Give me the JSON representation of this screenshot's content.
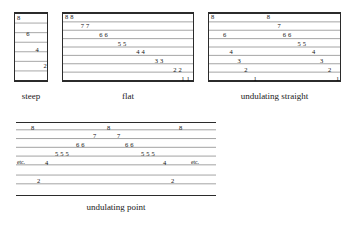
{
  "figure": {
    "kind": "contour-gradient-plan-diagram",
    "background_color": "#ffffff",
    "contour_color": "#8c8c8c",
    "frame_color": "#2b2b2b",
    "text_color": "#111111"
  },
  "panels": [
    {
      "id": "steep",
      "caption": "steep",
      "boxed": true,
      "x": 14,
      "y": 12,
      "w": 34,
      "h": 70,
      "contours": [
        {
          "y": 0.0,
          "heavy": true,
          "x1": 0.0,
          "x2": 1.0
        },
        {
          "y": 0.143,
          "heavy": false,
          "x1": 0.0,
          "x2": 1.0
        },
        {
          "y": 0.286,
          "heavy": false,
          "x1": 0.0,
          "x2": 1.0
        },
        {
          "y": 0.429,
          "heavy": false,
          "x1": 0.0,
          "x2": 1.0
        },
        {
          "y": 0.571,
          "heavy": false,
          "x1": 0.0,
          "x2": 1.0
        },
        {
          "y": 0.714,
          "heavy": false,
          "x1": 0.0,
          "x2": 1.0
        },
        {
          "y": 0.857,
          "heavy": false,
          "x1": 0.0,
          "x2": 1.0
        },
        {
          "y": 1.0,
          "heavy": true,
          "x1": 0.0,
          "x2": 1.0
        }
      ],
      "labels": [
        {
          "text": "8",
          "x": 0.06,
          "y": 0.03
        },
        {
          "text": "6",
          "x": 0.33,
          "y": 0.25
        },
        {
          "text": "4",
          "x": 0.6,
          "y": 0.48
        },
        {
          "text": "2",
          "x": 0.84,
          "y": 0.71
        }
      ],
      "etc": []
    },
    {
      "id": "flat",
      "caption": "flat",
      "boxed": true,
      "x": 62,
      "y": 12,
      "w": 132,
      "h": 70,
      "contours": [
        {
          "y": 0.0,
          "heavy": true,
          "x1": 0.0,
          "x2": 1.0
        },
        {
          "y": 0.125,
          "heavy": false,
          "x1": 0.0,
          "x2": 1.0
        },
        {
          "y": 0.25,
          "heavy": false,
          "x1": 0.0,
          "x2": 1.0
        },
        {
          "y": 0.375,
          "heavy": false,
          "x1": 0.0,
          "x2": 1.0
        },
        {
          "y": 0.5,
          "heavy": false,
          "x1": 0.0,
          "x2": 1.0
        },
        {
          "y": 0.625,
          "heavy": false,
          "x1": 0.0,
          "x2": 1.0
        },
        {
          "y": 0.75,
          "heavy": false,
          "x1": 0.0,
          "x2": 1.0
        },
        {
          "y": 0.875,
          "heavy": false,
          "x1": 0.0,
          "x2": 1.0
        },
        {
          "y": 1.0,
          "heavy": true,
          "x1": 0.0,
          "x2": 1.0
        }
      ],
      "labels": [
        {
          "text": "8 8",
          "x": 0.015,
          "y": 0.02
        },
        {
          "text": "7 7",
          "x": 0.135,
          "y": 0.145
        },
        {
          "text": "6 6",
          "x": 0.275,
          "y": 0.27
        },
        {
          "text": "5 5",
          "x": 0.415,
          "y": 0.395
        },
        {
          "text": "4 4",
          "x": 0.555,
          "y": 0.52
        },
        {
          "text": "3 3",
          "x": 0.695,
          "y": 0.645
        },
        {
          "text": "2 2",
          "x": 0.835,
          "y": 0.77
        },
        {
          "text": "1 1",
          "x": 0.895,
          "y": 0.895
        }
      ],
      "etc": []
    },
    {
      "id": "undulating-straight",
      "caption": "undulating straight",
      "boxed": true,
      "x": 208,
      "y": 12,
      "w": 133,
      "h": 70,
      "contours": [
        {
          "y": 0.0,
          "heavy": true,
          "x1": 0.0,
          "x2": 1.0
        },
        {
          "y": 0.125,
          "heavy": false,
          "x1": 0.0,
          "x2": 1.0
        },
        {
          "y": 0.25,
          "heavy": false,
          "x1": 0.0,
          "x2": 1.0
        },
        {
          "y": 0.375,
          "heavy": false,
          "x1": 0.0,
          "x2": 1.0
        },
        {
          "y": 0.5,
          "heavy": false,
          "x1": 0.0,
          "x2": 1.0
        },
        {
          "y": 0.625,
          "heavy": false,
          "x1": 0.0,
          "x2": 1.0
        },
        {
          "y": 0.75,
          "heavy": false,
          "x1": 0.0,
          "x2": 1.0
        },
        {
          "y": 0.875,
          "heavy": false,
          "x1": 0.0,
          "x2": 1.0
        },
        {
          "y": 1.0,
          "heavy": true,
          "x1": 0.0,
          "x2": 1.0
        }
      ],
      "labels": [
        {
          "text": "8",
          "x": 0.015,
          "y": 0.02
        },
        {
          "text": "8",
          "x": 0.435,
          "y": 0.02
        },
        {
          "text": "7",
          "x": 0.515,
          "y": 0.145
        },
        {
          "text": "6",
          "x": 0.105,
          "y": 0.27
        },
        {
          "text": "6 6",
          "x": 0.555,
          "y": 0.27
        },
        {
          "text": "5 5",
          "x": 0.665,
          "y": 0.395
        },
        {
          "text": "4",
          "x": 0.155,
          "y": 0.52
        },
        {
          "text": "4",
          "x": 0.775,
          "y": 0.52
        },
        {
          "text": "3",
          "x": 0.215,
          "y": 0.645
        },
        {
          "text": "3",
          "x": 0.835,
          "y": 0.645
        },
        {
          "text": "2",
          "x": 0.265,
          "y": 0.77
        },
        {
          "text": "2",
          "x": 0.895,
          "y": 0.77
        },
        {
          "text": "1",
          "x": 0.335,
          "y": 0.895
        },
        {
          "text": "1",
          "x": 0.955,
          "y": 0.895
        }
      ],
      "etc": []
    },
    {
      "id": "undulating-point",
      "caption": "undulating point",
      "boxed": false,
      "x": 16,
      "y": 122,
      "w": 200,
      "h": 74,
      "contours": [
        {
          "y": 0.0,
          "heavy": true,
          "x1": 0.0,
          "x2": 1.0
        },
        {
          "y": 0.1,
          "heavy": false,
          "x1": 0.0,
          "x2": 1.0
        },
        {
          "y": 0.22,
          "heavy": false,
          "x1": 0.0,
          "x2": 1.0
        },
        {
          "y": 0.34,
          "heavy": false,
          "x1": 0.0,
          "x2": 1.0
        },
        {
          "y": 0.46,
          "heavy": false,
          "x1": 0.0,
          "x2": 1.0
        },
        {
          "y": 0.58,
          "heavy": false,
          "x1": 0.0,
          "x2": 1.0
        },
        {
          "y": 0.72,
          "heavy": false,
          "x1": 0.0,
          "x2": 1.0
        },
        {
          "y": 0.84,
          "heavy": false,
          "x1": 0.0,
          "x2": 1.0
        },
        {
          "y": 1.0,
          "heavy": true,
          "x1": 0.0,
          "x2": 1.0
        }
      ],
      "labels": [
        {
          "text": "8",
          "x": 0.075,
          "y": 0.035
        },
        {
          "text": "8",
          "x": 0.455,
          "y": 0.035
        },
        {
          "text": "8",
          "x": 0.815,
          "y": 0.035
        },
        {
          "text": "7",
          "x": 0.385,
          "y": 0.155
        },
        {
          "text": "7",
          "x": 0.505,
          "y": 0.155
        },
        {
          "text": "6 6",
          "x": 0.3,
          "y": 0.275
        },
        {
          "text": "6 6",
          "x": 0.545,
          "y": 0.275
        },
        {
          "text": "5 5 5",
          "x": 0.195,
          "y": 0.395
        },
        {
          "text": "5 5 5",
          "x": 0.625,
          "y": 0.395
        },
        {
          "text": "4",
          "x": 0.145,
          "y": 0.515
        },
        {
          "text": "4",
          "x": 0.735,
          "y": 0.515
        },
        {
          "text": "2",
          "x": 0.105,
          "y": 0.755
        },
        {
          "text": "2",
          "x": 0.775,
          "y": 0.755
        }
      ],
      "etc": [
        {
          "text": "etc.",
          "x": 0.005,
          "y": 0.515
        },
        {
          "text": "etc.",
          "x": 0.875,
          "y": 0.515
        }
      ]
    }
  ],
  "captions": [
    {
      "id": "caption-steep",
      "text": "steep",
      "x": 14,
      "y": 92,
      "w": 34
    },
    {
      "id": "caption-flat",
      "text": "flat",
      "x": 62,
      "y": 92,
      "w": 132
    },
    {
      "id": "caption-undulating-straight",
      "text": "undulating straight",
      "x": 208,
      "y": 92,
      "w": 133
    },
    {
      "id": "caption-undulating-point",
      "text": "undulating point",
      "x": 16,
      "y": 203,
      "w": 200
    }
  ]
}
